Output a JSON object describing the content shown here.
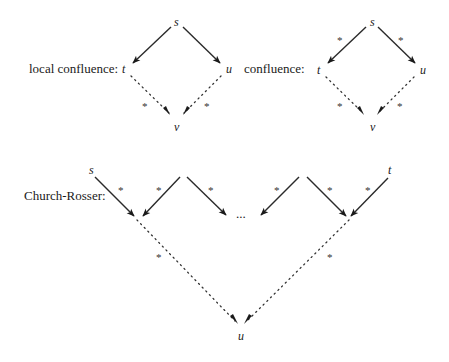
{
  "diagrams": {
    "local_confluence": {
      "label": "local confluence:",
      "nodes": {
        "top": "s",
        "left": "t",
        "right": "u",
        "bottom": "v"
      },
      "stars": [
        "*",
        "*"
      ]
    },
    "confluence": {
      "label": "confluence:",
      "nodes": {
        "top": "s",
        "left": "t",
        "right": "u",
        "bottom": "v"
      },
      "stars": [
        "*",
        "*",
        "*",
        "*"
      ]
    },
    "church_rosser": {
      "label": "Church-Rosser:",
      "nodes": {
        "start": "s",
        "end": "t",
        "bottom": "u"
      },
      "ellipsis": "...",
      "stars": [
        "*",
        "*",
        "*",
        "*",
        "*",
        "*",
        "*",
        "*"
      ]
    }
  },
  "colors": {
    "ink": "#2a2a2a",
    "background": "#ffffff"
  }
}
